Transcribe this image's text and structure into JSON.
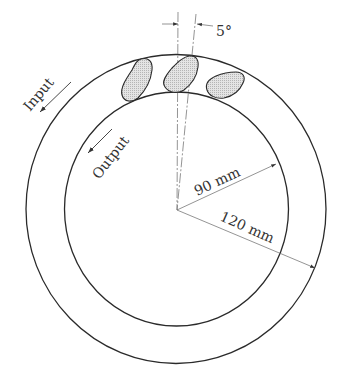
{
  "diagram": {
    "type": "tilting-pad thrust bearing (plan view)",
    "labels": {
      "input": "Input",
      "output": "Output",
      "inner_radius": "90 mm",
      "outer_radius": "120 mm",
      "tilt_angle": "5°"
    },
    "geometry": {
      "inner_radius_mm": 90,
      "outer_radius_mm": 120,
      "pad_offset_angle_deg": 5,
      "pads_visible": 3
    },
    "colors": {
      "line": "#2a2a2a",
      "pad_fill": "#d9d9d9",
      "background": "#ffffff"
    }
  }
}
